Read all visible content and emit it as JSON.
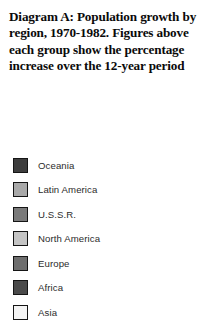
{
  "caption": {
    "lines": [
      "Diagram A: Population growth by",
      "region, 1970-1982. Figures above",
      "each group show the percentage",
      "increase over the 12-year period"
    ],
    "full_text": "Diagram A: Population growth by region, 1970-1982. Figures above each group show the percentage increase over the 12-year period"
  },
  "legend": {
    "items": [
      {
        "label": "Oceania",
        "color": "#3d3d3d",
        "border": "#151515"
      },
      {
        "label": "Latin America",
        "color": "#a9a9a9",
        "border": "#151515"
      },
      {
        "label": "U.S.S.R.",
        "color": "#7a7a7a",
        "border": "#151515"
      },
      {
        "label": "North America",
        "color": "#c4c4c4",
        "border": "#151515"
      },
      {
        "label": "Europe",
        "color": "#6e6e6e",
        "border": "#151515"
      },
      {
        "label": "Africa",
        "color": "#4a4a4a",
        "border": "#151515"
      },
      {
        "label": "Asia",
        "color": "#f4f4f4",
        "border": "#151515"
      }
    ]
  },
  "chart_data": {
    "type": "bar",
    "title": "Diagram A: Population growth by region, 1970-1982. Figures above each group show the percentage increase over the 12-year period",
    "subtitle": "",
    "xlabel": "",
    "ylabel": "",
    "categories": [],
    "series": [
      {
        "name": "Oceania",
        "values": []
      },
      {
        "name": "Latin America",
        "values": []
      },
      {
        "name": "U.S.S.R.",
        "values": []
      },
      {
        "name": "North America",
        "values": []
      },
      {
        "name": "Europe",
        "values": []
      },
      {
        "name": "Africa",
        "values": []
      },
      {
        "name": "Asia",
        "values": []
      }
    ],
    "legend_position": "left",
    "legend_entries": [
      "Oceania",
      "Latin America",
      "U.S.S.R.",
      "North America",
      "Europe",
      "Africa",
      "Asia"
    ],
    "grid": false,
    "note": "Only the caption and legend key are visible in this crop; no plotted bars, axes, tick labels or data values are rendered in the image."
  }
}
